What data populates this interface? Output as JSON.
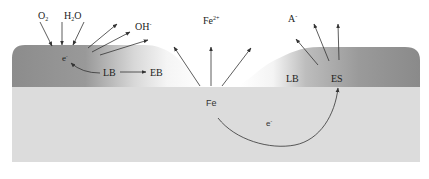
{
  "diagram": {
    "colors": {
      "substrate": "#dcdcdc",
      "coating_dark": "#8e8e8e",
      "coating_light": "#f2f2f2",
      "arrow": "#333333",
      "background": "#ffffff"
    },
    "labels": {
      "o2": "O",
      "o2_sub": "2",
      "h2o_h": "H",
      "h2o_sub": "2",
      "h2o_o": "O",
      "oh": "OH",
      "oh_sup": "-",
      "fe_ion": "Fe",
      "fe_ion_sup": "2+",
      "anion": "A",
      "anion_sup": "-",
      "electron_left": "e",
      "electron_left_sup": "-",
      "lb_left": "LB",
      "eb": "EB",
      "lb_right": "LB",
      "es": "ES",
      "fe_metal": "Fe",
      "electron_bottom": "e",
      "electron_bottom_sup": "-"
    },
    "nodes": [
      {
        "id": "O2",
        "role": "reactant-in"
      },
      {
        "id": "H2O",
        "role": "reactant-in"
      },
      {
        "id": "OH-",
        "role": "product-out"
      },
      {
        "id": "Fe2+",
        "role": "product-out"
      },
      {
        "id": "A-",
        "role": "product-out"
      },
      {
        "id": "e-",
        "role": "electron at cathode"
      },
      {
        "id": "LB",
        "role": "loss of bonding"
      },
      {
        "id": "EB",
        "role": "edge of blister"
      },
      {
        "id": "ES",
        "role": "electron sink"
      },
      {
        "id": "Fe",
        "role": "metal substrate anode"
      }
    ],
    "edges": [
      {
        "from": "O2",
        "to": "e-"
      },
      {
        "from": "H2O",
        "to": "e-"
      },
      {
        "from": "e-",
        "to": "OH-"
      },
      {
        "from": "LB",
        "to": "e-"
      },
      {
        "from": "LB",
        "to": "EB"
      },
      {
        "from": "Fe",
        "to": "Fe2+"
      },
      {
        "from": "ES",
        "to": "A-"
      },
      {
        "from": "Fe",
        "to": "ES",
        "label": "e-"
      }
    ]
  }
}
